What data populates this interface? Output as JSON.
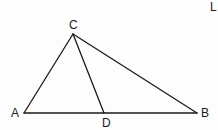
{
  "figure": {
    "type": "triangle-with-cevian",
    "corner_fragment": "L",
    "points": {
      "A": {
        "label": "A",
        "x": 24,
        "y": 113,
        "label_x": 11,
        "label_y": 117
      },
      "B": {
        "label": "B",
        "x": 197,
        "y": 113,
        "label_x": 201,
        "label_y": 117
      },
      "C": {
        "label": "C",
        "x": 73,
        "y": 34,
        "label_x": 69,
        "label_y": 29
      },
      "D": {
        "label": "D",
        "x": 104,
        "y": 113,
        "label_x": 102,
        "label_y": 127
      }
    },
    "segments": [
      {
        "name": "AC",
        "from": "A",
        "to": "C"
      },
      {
        "name": "CB",
        "from": "C",
        "to": "B"
      },
      {
        "name": "AB",
        "from": "A",
        "to": "B"
      },
      {
        "name": "CD",
        "from": "C",
        "to": "D"
      }
    ],
    "stroke_color": "#1a1a1a",
    "background": "#fdfdfd"
  }
}
